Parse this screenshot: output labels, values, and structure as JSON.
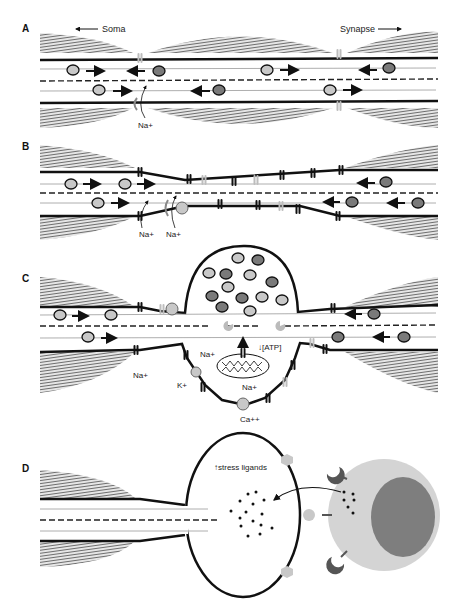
{
  "figure": {
    "panels": [
      {
        "id": "A",
        "label": "A",
        "labels": {
          "soma": "Soma",
          "synapse": "Synapse",
          "na": "Na+"
        }
      },
      {
        "id": "B",
        "label": "B",
        "labels": {
          "na_left": "Na+",
          "na_right": "Na+"
        }
      },
      {
        "id": "C",
        "label": "C",
        "labels": {
          "na_left": "Na+",
          "na_pump": "Na+",
          "k": "K+",
          "atp": "[ATP]",
          "na_exchanger": "Na+",
          "ca": "Ca++"
        }
      },
      {
        "id": "D",
        "label": "D",
        "labels": {
          "stress": "stress ligands"
        }
      }
    ],
    "colors": {
      "myelin": "#8a8a8a",
      "membrane": "#111111",
      "vesicle_light": "#c8c8c8",
      "vesicle_dark": "#7a7a7a",
      "channel_light": "#bdbdbd",
      "immune_cell": "#d4d4d4",
      "immune_nucleus": "#7e7e7e",
      "receptor": "#555555"
    }
  }
}
